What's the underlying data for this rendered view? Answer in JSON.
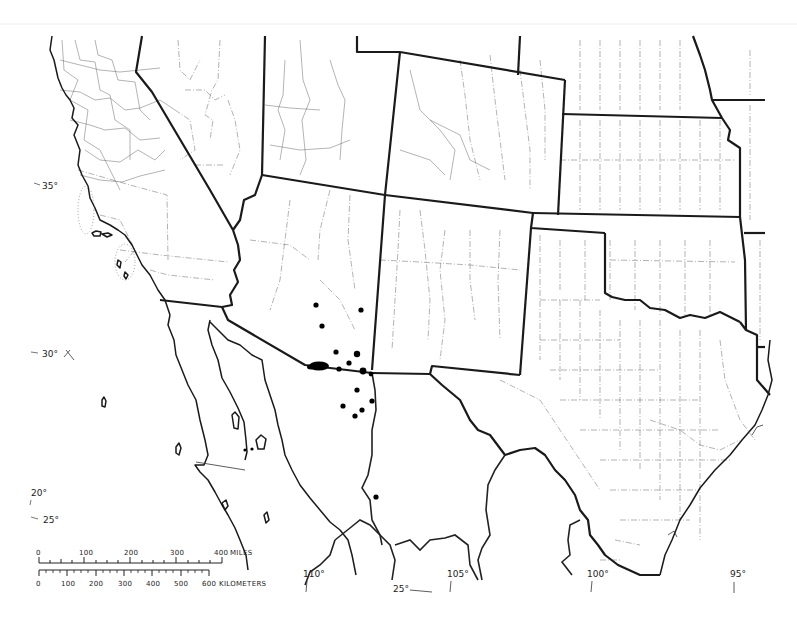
{
  "map": {
    "type": "distribution-map",
    "region": "Southwestern United States and northern Mexico",
    "locality_marker_color": "#000000",
    "line_color": "#1a1a1a",
    "background": "#ffffff"
  },
  "graticule_labels": {
    "lat_35": "35°",
    "lat_30": "30°",
    "lat_25_left": "25°",
    "lat_20": "20°",
    "lat_25_bottom": "25°",
    "lon_110": "110°",
    "lon_105": "105°",
    "lon_100": "100°",
    "lon_95": "95°"
  },
  "scale_bar": {
    "miles": {
      "ticks": [
        "0",
        "100",
        "200",
        "300",
        "400"
      ],
      "unit": "MILES"
    },
    "kilometers": {
      "ticks": [
        "0",
        "100",
        "200",
        "300",
        "400",
        "500",
        "600"
      ],
      "unit": "KILOMETERS"
    }
  },
  "localities": [
    {
      "x": 316,
      "y": 305,
      "r": 2.6
    },
    {
      "x": 361,
      "y": 310,
      "r": 2.6
    },
    {
      "x": 322,
      "y": 326,
      "r": 2.6
    },
    {
      "x": 336,
      "y": 352,
      "r": 2.6
    },
    {
      "x": 349,
      "y": 363,
      "r": 2.6
    },
    {
      "x": 339,
      "y": 369,
      "r": 2.6
    },
    {
      "x": 357,
      "y": 354,
      "r": 3.2
    },
    {
      "x": 363,
      "y": 371,
      "r": 3.4
    },
    {
      "x": 371,
      "y": 374,
      "r": 2.4
    },
    {
      "x": 357,
      "y": 390,
      "r": 2.6
    },
    {
      "x": 372,
      "y": 401,
      "r": 2.6
    },
    {
      "x": 343,
      "y": 406,
      "r": 2.6
    },
    {
      "x": 362,
      "y": 410,
      "r": 2.6
    },
    {
      "x": 355,
      "y": 416,
      "r": 2.6
    },
    {
      "x": 376,
      "y": 497,
      "r": 2.6
    },
    {
      "x": 245,
      "y": 450,
      "r": 1.6
    },
    {
      "x": 252,
      "y": 449,
      "r": 1.6
    }
  ],
  "locality_cluster": {
    "cx": 319,
    "cy": 366,
    "rx": 9,
    "ry": 5
  }
}
